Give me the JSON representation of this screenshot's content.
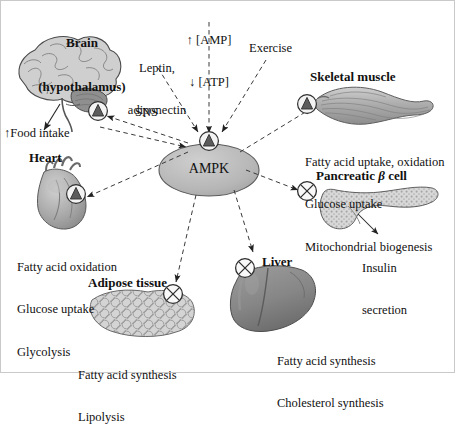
{
  "figure": {
    "type": "signaling-pathway-diagram",
    "subject": "AMPK",
    "central_node": {
      "label": "AMPK",
      "shape": "ellipse",
      "fill": "#b9b9b9"
    },
    "symbols": {
      "activation": {
        "name": "activation-symbol",
        "glyph": "circled-triangle",
        "meaning": "activation"
      },
      "inhibition": {
        "name": "inhibition-symbol",
        "glyph": "circled-x",
        "meaning": "inhibition"
      }
    }
  },
  "inputs": [
    {
      "id": "amp-atp",
      "lines": [
        "↑ [AMP]",
        "↓ [ATP]"
      ],
      "target": "AMPK"
    },
    {
      "id": "leptin",
      "lines": [
        "Leptin,",
        "adiponectin"
      ],
      "target": "AMPK"
    },
    {
      "id": "exercise",
      "lines": [
        "Exercise"
      ],
      "target": "AMPK"
    }
  ],
  "connector_labels": {
    "sns": "SNS"
  },
  "organs": [
    {
      "id": "brain",
      "title": [
        "Brain",
        "(hypothalamus)"
      ],
      "effect_symbol": "activation",
      "outputs": [
        "↑Food intake"
      ],
      "effects": []
    },
    {
      "id": "skeletal-muscle",
      "title": [
        "Skeletal muscle"
      ],
      "effect_symbol": "activation",
      "outputs": [],
      "effects": [
        "Fatty acid uptake, oxidation",
        "Glucose uptake",
        "Mitochondrial biogenesis"
      ]
    },
    {
      "id": "heart",
      "title": [
        "Heart"
      ],
      "effect_symbol": "activation",
      "outputs": [],
      "effects": [
        "Fatty acid oxidation",
        "Glucose uptake",
        "Glycolysis"
      ]
    },
    {
      "id": "pancreatic-beta-cell",
      "title": [
        "Pancreatic β cell"
      ],
      "effect_symbol": "inhibition",
      "outputs": [
        "Insulin",
        "secretion"
      ],
      "effects": []
    },
    {
      "id": "adipose-tissue",
      "title": [
        "Adipose tissue"
      ],
      "effect_symbol": "inhibition",
      "outputs": [],
      "effects": [
        "Fatty acid synthesis",
        "Lipolysis"
      ]
    },
    {
      "id": "liver",
      "title": [
        "Liver"
      ],
      "effect_symbol": "inhibition",
      "outputs": [],
      "effects": [
        "Fatty acid synthesis",
        "Cholesterol synthesis"
      ]
    }
  ],
  "text": {
    "brain_title_1": "Brain",
    "brain_title_2": "(hypothalamus)",
    "food_intake": "↑Food intake",
    "heart_title": "Heart",
    "heart_l1": "Fatty acid oxidation",
    "heart_l2": "Glucose uptake",
    "heart_l3": "Glycolysis",
    "amp": "↑ [AMP]",
    "atp": "↓ [ATP]",
    "leptin_l1": "Leptin,",
    "leptin_l2": "adiponectin",
    "exercise": "Exercise",
    "sns": "SNS",
    "ampk": "AMPK",
    "muscle_title": "Skeletal muscle",
    "muscle_l1": "Fatty acid uptake, oxidation",
    "muscle_l2": "Glucose uptake",
    "muscle_l3": "Mitochondrial biogenesis",
    "pancreas_title_a": "Pancreatic ",
    "pancreas_title_b": "β",
    "pancreas_title_c": " cell",
    "insulin_l1": "Insulin",
    "insulin_l2": "secretion",
    "adipose_title": "Adipose tissue",
    "adipose_l1": "Fatty acid synthesis",
    "adipose_l2": "Lipolysis",
    "liver_title": "Liver",
    "liver_l1": "Fatty acid synthesis",
    "liver_l2": "Cholesterol synthesis"
  },
  "colors": {
    "organ_gray": "#9a9a9a",
    "organ_light": "#c6c6c6",
    "organ_dark": "#7d7d7d",
    "ampk_fill": "#b9b9b9",
    "stroke": "#333333",
    "text": "#111111"
  }
}
